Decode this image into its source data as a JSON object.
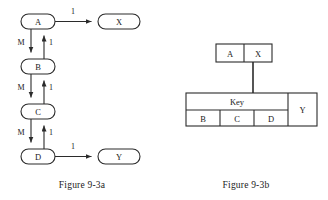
{
  "figure_a": {
    "caption": "Figure 9-3a",
    "nodes": [
      {
        "id": "A",
        "label": "A"
      },
      {
        "id": "B",
        "label": "B"
      },
      {
        "id": "C",
        "label": "C"
      },
      {
        "id": "D",
        "label": "D"
      },
      {
        "id": "X",
        "label": "X"
      },
      {
        "id": "Y",
        "label": "Y"
      }
    ],
    "edges": [
      {
        "from": "A",
        "to": "X",
        "label": "1",
        "direction": "right"
      },
      {
        "from": "A",
        "to": "B",
        "label": "M",
        "direction": "down"
      },
      {
        "from": "B",
        "to": "A",
        "label": "1",
        "direction": "up"
      },
      {
        "from": "B",
        "to": "C",
        "label": "M",
        "direction": "down"
      },
      {
        "from": "C",
        "to": "B",
        "label": "1",
        "direction": "up"
      },
      {
        "from": "C",
        "to": "D",
        "label": "M",
        "direction": "down"
      },
      {
        "from": "D",
        "to": "C",
        "label": "1",
        "direction": "up"
      },
      {
        "from": "D",
        "to": "Y",
        "label": "1",
        "direction": "right"
      }
    ],
    "edge_labels": {
      "a_to_x": "1",
      "a_to_b": "M",
      "b_to_a": "1",
      "b_to_c": "M",
      "c_to_b": "1",
      "c_to_d": "M",
      "d_to_c": "1",
      "d_to_y": "1"
    }
  },
  "figure_b": {
    "caption": "Figure 9-3b",
    "top_table": {
      "cells": [
        "A",
        "X"
      ]
    },
    "bottom_table": {
      "header_label": "Key",
      "key_columns": [
        "B",
        "C",
        "D"
      ],
      "side_cell": "Y"
    }
  },
  "colors": {
    "stroke": "#2b2b2b",
    "text": "#1a1a1a",
    "background": "#ffffff"
  }
}
